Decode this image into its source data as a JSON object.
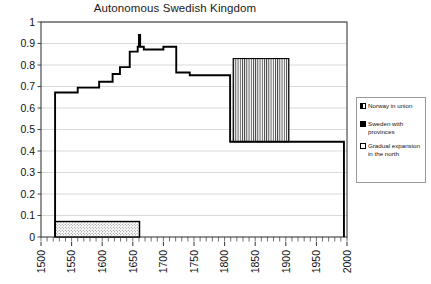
{
  "chart_data": {
    "type": "area",
    "title": "Autonomous Swedish Kingdom",
    "xlabel": "",
    "ylabel": "",
    "xlim": [
      1500,
      2000
    ],
    "ylim": [
      0,
      1
    ],
    "grid": true,
    "x_ticks": [
      1500,
      1550,
      1600,
      1650,
      1700,
      1750,
      1800,
      1850,
      1900,
      1950,
      2000
    ],
    "x_tick_labels": [
      "1500",
      "1550",
      "1600",
      "1650",
      "1700",
      "1750",
      "1800",
      "1850",
      "1900",
      "1950",
      "2000"
    ],
    "x_minor_tick_step": 10,
    "y_ticks": [
      0,
      0.1,
      0.2,
      0.3,
      0.4,
      0.5,
      0.6,
      0.7,
      0.8,
      0.9,
      1
    ],
    "y_tick_labels": [
      "0",
      "0.1",
      "0.2",
      "0.3",
      "0.4",
      "0.5",
      "0.6",
      "0.7",
      "0.8",
      "0.9",
      "1"
    ],
    "legend_position": "right",
    "series": [
      {
        "name": "Sweden with provinces",
        "style": "step-outline",
        "steps": [
          {
            "x": 1523,
            "y": 0.0
          },
          {
            "x": 1523,
            "y": 0.672
          },
          {
            "x": 1560,
            "y": 0.672
          },
          {
            "x": 1560,
            "y": 0.695
          },
          {
            "x": 1595,
            "y": 0.695
          },
          {
            "x": 1595,
            "y": 0.722
          },
          {
            "x": 1617,
            "y": 0.722
          },
          {
            "x": 1617,
            "y": 0.758
          },
          {
            "x": 1629,
            "y": 0.758
          },
          {
            "x": 1629,
            "y": 0.79
          },
          {
            "x": 1645,
            "y": 0.79
          },
          {
            "x": 1645,
            "y": 0.862
          },
          {
            "x": 1658,
            "y": 0.862
          },
          {
            "x": 1658,
            "y": 0.885
          },
          {
            "x": 1660,
            "y": 0.885
          },
          {
            "x": 1660,
            "y": 0.94
          },
          {
            "x": 1662,
            "y": 0.94
          },
          {
            "x": 1662,
            "y": 0.885
          },
          {
            "x": 1668,
            "y": 0.885
          },
          {
            "x": 1668,
            "y": 0.872
          },
          {
            "x": 1700,
            "y": 0.872
          },
          {
            "x": 1700,
            "y": 0.885
          },
          {
            "x": 1721,
            "y": 0.885
          },
          {
            "x": 1721,
            "y": 0.765
          },
          {
            "x": 1743,
            "y": 0.765
          },
          {
            "x": 1743,
            "y": 0.752
          },
          {
            "x": 1809,
            "y": 0.752
          },
          {
            "x": 1809,
            "y": 0.443
          },
          {
            "x": 1995,
            "y": 0.443
          },
          {
            "x": 1995,
            "y": 0.0
          }
        ]
      },
      {
        "name": "Norway in union",
        "style": "vertical-hatch-rect",
        "x_start": 1814,
        "x_end": 1905,
        "y_bottom": 0.443,
        "y_top": 0.83
      },
      {
        "name": "Gradual expansion in the north",
        "style": "dotted-rect",
        "x_start": 1523,
        "x_end": 1661,
        "y_bottom": 0.0,
        "y_top": 0.072
      }
    ]
  },
  "legend": {
    "entries": [
      {
        "label": "Norway in union",
        "swatch": "hatched-square-icon"
      },
      {
        "label": "Sweden with provinces",
        "swatch": "filled-square-icon"
      },
      {
        "label": "Gradual expansion in the north",
        "swatch": "empty-square-icon"
      }
    ]
  },
  "colors": {
    "line": "#000000",
    "grid": "#c8c8c8",
    "axis": "#333333",
    "background": "#ffffff"
  }
}
